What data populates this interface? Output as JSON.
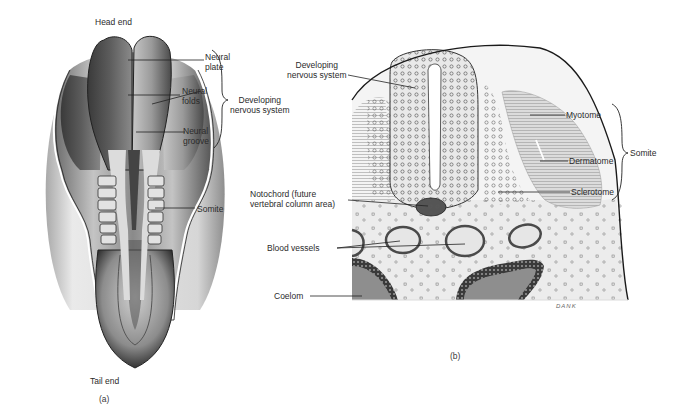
{
  "figure": {
    "panel_a": {
      "caption": "(a)",
      "top_label": "Head end",
      "bottom_label": "Tail end",
      "labels": {
        "neural_plate": "Neural\nplate",
        "neural_folds": "Neural\nfolds",
        "neural_groove": "Neural\ngroove",
        "somite": "Somite"
      },
      "bracket_label": "Developing\nnervous system"
    },
    "panel_b": {
      "caption": "(b)",
      "labels": {
        "developing_nervous_system": "Developing\nnervous system",
        "notochord": "Notochord (future\nvertebral column area)",
        "blood_vessels": "Blood vessels",
        "coelom": "Coelom",
        "myotome": "Myotome",
        "dermatome": "Dermatome",
        "sclerotome": "Sclerotome"
      },
      "bracket_label": "Somite",
      "artist_signature": "DANK"
    }
  }
}
